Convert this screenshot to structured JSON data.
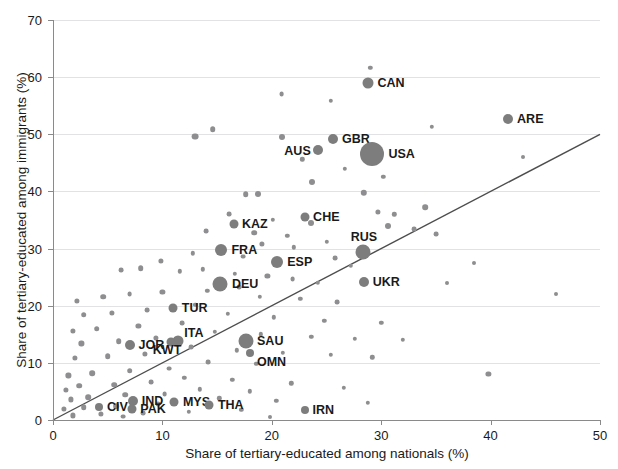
{
  "chart_data": {
    "type": "scatter",
    "title": "",
    "xlabel": "Share of tertiary-educated among nationals (%)",
    "ylabel": "Share of tertiary-educated among immigrants (%)",
    "xlim": [
      0,
      50
    ],
    "ylim": [
      0,
      70
    ],
    "xticks": [
      0,
      10,
      20,
      30,
      40,
      50
    ],
    "yticks": [
      0,
      10,
      20,
      30,
      40,
      50,
      60,
      70
    ],
    "grid": "horizontal",
    "legend": "none",
    "reference_line": {
      "type": "identity",
      "label": "y = x",
      "from": [
        0,
        0
      ],
      "to": [
        50,
        50
      ]
    },
    "marker_color": "#7d7d7d",
    "gridline_color": "#e2e2e4",
    "axis_color": "#8a8a8a",
    "note": "Marker area is proportional to immigrant population size; USA, DEU, SAU, RUS drawn largest.",
    "labeled_points": [
      {
        "label": "CAN",
        "x": 28.8,
        "y": 59.0,
        "size": 5.5,
        "label_side": "right"
      },
      {
        "label": "ARE",
        "x": 41.6,
        "y": 52.7,
        "size": 5.0,
        "label_side": "right"
      },
      {
        "label": "GBR",
        "x": 25.6,
        "y": 49.2,
        "size": 5.0,
        "label_side": "right"
      },
      {
        "label": "AUS",
        "x": 24.2,
        "y": 47.2,
        "size": 5.0,
        "label_side": "below-left"
      },
      {
        "label": "USA",
        "x": 29.2,
        "y": 46.6,
        "size": 12.0,
        "label_side": "right"
      },
      {
        "label": "CHE",
        "x": 23.0,
        "y": 35.6,
        "size": 4.5,
        "label_side": "right"
      },
      {
        "label": "KAZ",
        "x": 16.5,
        "y": 34.3,
        "size": 4.5,
        "label_side": "right"
      },
      {
        "label": "FRA",
        "x": 15.4,
        "y": 29.8,
        "size": 6.0,
        "label_side": "right"
      },
      {
        "label": "RUS",
        "x": 28.3,
        "y": 29.4,
        "size": 7.5,
        "label_side": "above"
      },
      {
        "label": "ESP",
        "x": 20.5,
        "y": 27.6,
        "size": 6.0,
        "label_side": "right"
      },
      {
        "label": "UKR",
        "x": 28.4,
        "y": 24.2,
        "size": 5.0,
        "label_side": "right"
      },
      {
        "label": "DEU",
        "x": 15.3,
        "y": 23.8,
        "size": 7.5,
        "label_side": "right"
      },
      {
        "label": "TUR",
        "x": 11.0,
        "y": 19.6,
        "size": 4.5,
        "label_side": "right"
      },
      {
        "label": "ITA",
        "x": 11.4,
        "y": 13.8,
        "size": 5.5,
        "label_side": "above-right"
      },
      {
        "label": "KWT",
        "x": 10.8,
        "y": 13.6,
        "size": 4.5,
        "label_side": "below"
      },
      {
        "label": "JOR",
        "x": 7.0,
        "y": 13.2,
        "size": 5.0,
        "label_side": "right"
      },
      {
        "label": "SAU",
        "x": 17.6,
        "y": 13.8,
        "size": 7.5,
        "label_side": "right"
      },
      {
        "label": "OMN",
        "x": 18.0,
        "y": 11.8,
        "size": 4.0,
        "label_side": "right-below"
      },
      {
        "label": "IND",
        "x": 7.3,
        "y": 3.4,
        "size": 5.0,
        "label_side": "right"
      },
      {
        "label": "PAK",
        "x": 7.2,
        "y": 1.9,
        "size": 4.5,
        "label_side": "right"
      },
      {
        "label": "MYS",
        "x": 11.1,
        "y": 3.2,
        "size": 4.5,
        "label_side": "right"
      },
      {
        "label": "THA",
        "x": 14.3,
        "y": 2.6,
        "size": 4.5,
        "label_side": "right"
      },
      {
        "label": "CIV",
        "x": 4.2,
        "y": 2.3,
        "size": 4.0,
        "label_side": "right"
      },
      {
        "label": "IRN",
        "x": 23.0,
        "y": 1.8,
        "size": 4.0,
        "label_side": "right"
      }
    ],
    "unlabeled_points": [
      {
        "x": 29.0,
        "y": 61.6,
        "size": 2.2
      },
      {
        "x": 20.9,
        "y": 57.1,
        "size": 2.4
      },
      {
        "x": 25.4,
        "y": 55.9,
        "size": 2.2
      },
      {
        "x": 14.6,
        "y": 50.9,
        "size": 2.8
      },
      {
        "x": 13.0,
        "y": 49.6,
        "size": 3.4
      },
      {
        "x": 20.9,
        "y": 49.6,
        "size": 3.0
      },
      {
        "x": 34.6,
        "y": 51.3,
        "size": 2.2
      },
      {
        "x": 22.8,
        "y": 45.6,
        "size": 2.2
      },
      {
        "x": 26.7,
        "y": 44.0,
        "size": 2.2
      },
      {
        "x": 23.7,
        "y": 41.6,
        "size": 3.0
      },
      {
        "x": 30.2,
        "y": 42.6,
        "size": 2.2
      },
      {
        "x": 18.7,
        "y": 39.6,
        "size": 3.0
      },
      {
        "x": 17.6,
        "y": 39.5,
        "size": 2.8
      },
      {
        "x": 28.4,
        "y": 39.8,
        "size": 3.2
      },
      {
        "x": 34.0,
        "y": 37.2,
        "size": 2.8
      },
      {
        "x": 29.7,
        "y": 36.4,
        "size": 2.6
      },
      {
        "x": 31.2,
        "y": 36.0,
        "size": 2.2
      },
      {
        "x": 16.1,
        "y": 36.0,
        "size": 2.4
      },
      {
        "x": 20.1,
        "y": 35.0,
        "size": 2.2
      },
      {
        "x": 23.6,
        "y": 34.4,
        "size": 3.0
      },
      {
        "x": 30.6,
        "y": 33.9,
        "size": 3.0
      },
      {
        "x": 33.0,
        "y": 33.4,
        "size": 2.4
      },
      {
        "x": 35.0,
        "y": 32.6,
        "size": 2.4
      },
      {
        "x": 18.4,
        "y": 32.8,
        "size": 2.8
      },
      {
        "x": 21.4,
        "y": 32.2,
        "size": 2.2
      },
      {
        "x": 14.0,
        "y": 33.0,
        "size": 2.4
      },
      {
        "x": 25.0,
        "y": 31.2,
        "size": 2.2
      },
      {
        "x": 19.1,
        "y": 30.8,
        "size": 2.6
      },
      {
        "x": 22.0,
        "y": 30.2,
        "size": 2.2
      },
      {
        "x": 17.4,
        "y": 28.6,
        "size": 2.4
      },
      {
        "x": 12.8,
        "y": 29.2,
        "size": 2.2
      },
      {
        "x": 25.8,
        "y": 28.4,
        "size": 2.4
      },
      {
        "x": 27.2,
        "y": 27.0,
        "size": 2.2
      },
      {
        "x": 9.9,
        "y": 27.8,
        "size": 2.6
      },
      {
        "x": 8.0,
        "y": 26.6,
        "size": 2.8
      },
      {
        "x": 6.2,
        "y": 26.2,
        "size": 2.4
      },
      {
        "x": 11.6,
        "y": 26.0,
        "size": 2.2
      },
      {
        "x": 13.7,
        "y": 26.4,
        "size": 2.2
      },
      {
        "x": 16.6,
        "y": 25.6,
        "size": 2.2
      },
      {
        "x": 19.6,
        "y": 25.2,
        "size": 2.6
      },
      {
        "x": 21.9,
        "y": 24.6,
        "size": 2.4
      },
      {
        "x": 24.2,
        "y": 24.0,
        "size": 2.2
      },
      {
        "x": 17.0,
        "y": 23.2,
        "size": 2.4
      },
      {
        "x": 14.1,
        "y": 22.6,
        "size": 2.2
      },
      {
        "x": 10.0,
        "y": 22.4,
        "size": 2.6
      },
      {
        "x": 7.0,
        "y": 22.0,
        "size": 2.4
      },
      {
        "x": 4.6,
        "y": 21.6,
        "size": 2.8
      },
      {
        "x": 2.2,
        "y": 20.8,
        "size": 2.6
      },
      {
        "x": 18.9,
        "y": 21.6,
        "size": 2.2
      },
      {
        "x": 22.6,
        "y": 21.2,
        "size": 2.2
      },
      {
        "x": 26.0,
        "y": 20.6,
        "size": 2.4
      },
      {
        "x": 13.0,
        "y": 20.2,
        "size": 2.2
      },
      {
        "x": 8.6,
        "y": 19.2,
        "size": 2.4
      },
      {
        "x": 5.4,
        "y": 18.8,
        "size": 2.6
      },
      {
        "x": 2.8,
        "y": 18.4,
        "size": 2.8
      },
      {
        "x": 16.0,
        "y": 18.6,
        "size": 2.2
      },
      {
        "x": 20.2,
        "y": 18.0,
        "size": 2.2
      },
      {
        "x": 24.8,
        "y": 17.4,
        "size": 2.2
      },
      {
        "x": 30.0,
        "y": 17.0,
        "size": 2.2
      },
      {
        "x": 11.8,
        "y": 17.0,
        "size": 2.4
      },
      {
        "x": 7.8,
        "y": 16.4,
        "size": 2.6
      },
      {
        "x": 4.0,
        "y": 16.0,
        "size": 2.8
      },
      {
        "x": 1.8,
        "y": 15.6,
        "size": 2.6
      },
      {
        "x": 14.8,
        "y": 15.4,
        "size": 2.2
      },
      {
        "x": 19.0,
        "y": 15.0,
        "size": 2.2
      },
      {
        "x": 23.6,
        "y": 14.6,
        "size": 2.2
      },
      {
        "x": 27.6,
        "y": 14.2,
        "size": 2.2
      },
      {
        "x": 32.0,
        "y": 14.0,
        "size": 2.2
      },
      {
        "x": 9.4,
        "y": 14.4,
        "size": 2.6
      },
      {
        "x": 6.0,
        "y": 13.8,
        "size": 2.8
      },
      {
        "x": 2.6,
        "y": 13.4,
        "size": 2.6
      },
      {
        "x": 12.6,
        "y": 12.8,
        "size": 2.4
      },
      {
        "x": 16.8,
        "y": 12.2,
        "size": 2.2
      },
      {
        "x": 21.0,
        "y": 11.8,
        "size": 2.2
      },
      {
        "x": 25.4,
        "y": 11.4,
        "size": 2.2
      },
      {
        "x": 29.2,
        "y": 11.0,
        "size": 2.2
      },
      {
        "x": 8.4,
        "y": 11.6,
        "size": 2.6
      },
      {
        "x": 5.0,
        "y": 11.2,
        "size": 2.8
      },
      {
        "x": 2.0,
        "y": 10.8,
        "size": 2.6
      },
      {
        "x": 14.2,
        "y": 10.2,
        "size": 2.4
      },
      {
        "x": 18.6,
        "y": 9.8,
        "size": 2.2
      },
      {
        "x": 39.8,
        "y": 8.0,
        "size": 2.6
      },
      {
        "x": 10.6,
        "y": 9.0,
        "size": 2.4
      },
      {
        "x": 7.0,
        "y": 8.6,
        "size": 2.8
      },
      {
        "x": 3.6,
        "y": 8.2,
        "size": 2.8
      },
      {
        "x": 1.4,
        "y": 7.8,
        "size": 2.6
      },
      {
        "x": 12.0,
        "y": 7.4,
        "size": 2.2
      },
      {
        "x": 16.4,
        "y": 7.0,
        "size": 2.2
      },
      {
        "x": 21.8,
        "y": 6.4,
        "size": 2.2
      },
      {
        "x": 9.0,
        "y": 6.6,
        "size": 2.4
      },
      {
        "x": 5.6,
        "y": 6.2,
        "size": 2.8
      },
      {
        "x": 2.4,
        "y": 6.0,
        "size": 2.8
      },
      {
        "x": 1.2,
        "y": 5.2,
        "size": 2.6
      },
      {
        "x": 13.4,
        "y": 5.4,
        "size": 2.2
      },
      {
        "x": 18.0,
        "y": 5.0,
        "size": 2.2
      },
      {
        "x": 26.6,
        "y": 5.6,
        "size": 2.2
      },
      {
        "x": 10.2,
        "y": 4.6,
        "size": 2.4
      },
      {
        "x": 6.6,
        "y": 4.4,
        "size": 2.8
      },
      {
        "x": 3.2,
        "y": 4.0,
        "size": 2.8
      },
      {
        "x": 1.6,
        "y": 3.6,
        "size": 2.6
      },
      {
        "x": 15.2,
        "y": 3.8,
        "size": 2.2
      },
      {
        "x": 20.4,
        "y": 3.4,
        "size": 2.2
      },
      {
        "x": 28.8,
        "y": 3.0,
        "size": 2.2
      },
      {
        "x": 9.6,
        "y": 2.8,
        "size": 2.4
      },
      {
        "x": 5.8,
        "y": 2.4,
        "size": 2.8
      },
      {
        "x": 2.8,
        "y": 2.2,
        "size": 2.8
      },
      {
        "x": 1.0,
        "y": 2.0,
        "size": 2.6
      },
      {
        "x": 17.2,
        "y": 1.8,
        "size": 2.2
      },
      {
        "x": 12.4,
        "y": 1.4,
        "size": 2.2
      },
      {
        "x": 8.2,
        "y": 1.2,
        "size": 2.4
      },
      {
        "x": 4.4,
        "y": 1.0,
        "size": 2.6
      },
      {
        "x": 1.8,
        "y": 0.8,
        "size": 2.6
      },
      {
        "x": 6.4,
        "y": 0.6,
        "size": 2.4
      },
      {
        "x": 19.8,
        "y": 0.6,
        "size": 2.0
      },
      {
        "x": 43.0,
        "y": 46.0,
        "size": 2.0
      },
      {
        "x": 46.0,
        "y": 22.0,
        "size": 2.0
      },
      {
        "x": 38.5,
        "y": 27.5,
        "size": 2.0
      },
      {
        "x": 36.0,
        "y": 24.0,
        "size": 2.0
      }
    ]
  }
}
